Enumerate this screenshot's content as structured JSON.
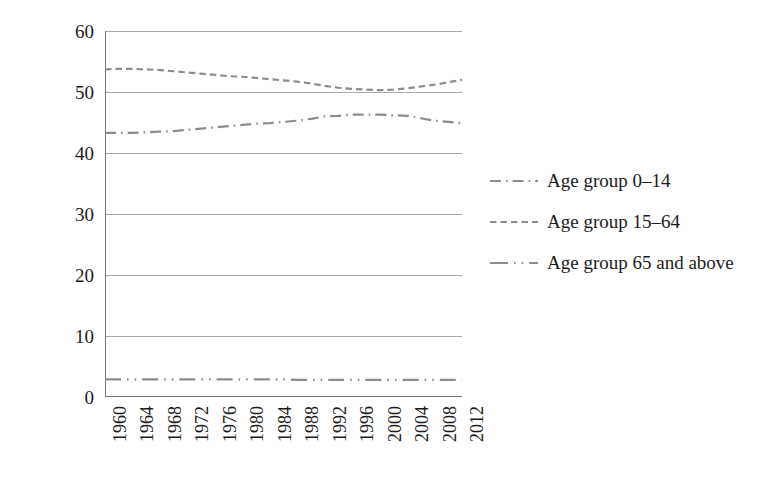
{
  "chart_data": {
    "type": "line",
    "title": "",
    "xlabel": "",
    "ylabel": "Age groups (%)",
    "xlim": [
      1960,
      2012
    ],
    "ylim": [
      0,
      60
    ],
    "grid": true,
    "legend_position": "right",
    "y_ticks": [
      60,
      50,
      40,
      30,
      20,
      10,
      0
    ],
    "x_ticks": [
      1960,
      1964,
      1968,
      1972,
      1976,
      1980,
      1984,
      1988,
      1992,
      1996,
      2000,
      2004,
      2008,
      2012
    ],
    "x_minor_tick_step": 1,
    "x": [
      1960,
      1962,
      1964,
      1966,
      1968,
      1970,
      1972,
      1974,
      1976,
      1978,
      1980,
      1982,
      1984,
      1986,
      1988,
      1990,
      1992,
      1994,
      1996,
      1998,
      2000,
      2002,
      2004,
      2006,
      2008,
      2010,
      2012
    ],
    "series": [
      {
        "name": "Age group 0–14",
        "dash": "dash-dot",
        "color": "#8c8c8c",
        "values": [
          43.3,
          43.3,
          43.3,
          43.4,
          43.5,
          43.6,
          43.8,
          44.0,
          44.2,
          44.4,
          44.6,
          44.8,
          44.9,
          45.1,
          45.3,
          45.6,
          46.0,
          46.1,
          46.3,
          46.3,
          46.3,
          46.2,
          46.1,
          45.7,
          45.3,
          45.1,
          44.9
        ]
      },
      {
        "name": "Age group 15–64",
        "dash": "dashed",
        "color": "#8c8c8c",
        "values": [
          53.7,
          53.8,
          53.8,
          53.7,
          53.6,
          53.4,
          53.2,
          53.0,
          52.8,
          52.6,
          52.5,
          52.3,
          52.1,
          51.9,
          51.7,
          51.4,
          51.0,
          50.7,
          50.5,
          50.4,
          50.3,
          50.4,
          50.6,
          50.9,
          51.2,
          51.6,
          52.0
        ]
      },
      {
        "name": "Age group 65 and above",
        "dash": "dash-dot-dot",
        "color": "#8c8c8c",
        "values": [
          2.9,
          2.9,
          2.9,
          2.9,
          2.9,
          2.9,
          2.9,
          2.9,
          2.9,
          2.9,
          2.9,
          2.9,
          2.9,
          2.9,
          2.8,
          2.8,
          2.8,
          2.8,
          2.8,
          2.8,
          2.8,
          2.8,
          2.8,
          2.8,
          2.8,
          2.8,
          2.8
        ]
      }
    ]
  },
  "axes": {
    "y_title": "Age groups (%)",
    "y_tick_labels": [
      "60",
      "50",
      "40",
      "30",
      "20",
      "10",
      "0"
    ],
    "x_tick_labels": [
      "1960",
      "1964",
      "1968",
      "1972",
      "1976",
      "1980",
      "1984",
      "1988",
      "1992",
      "1996",
      "2000",
      "2004",
      "2008",
      "2012"
    ]
  },
  "legend": {
    "items": [
      {
        "label": "Age group 0–14",
        "key": "dash-dot-key"
      },
      {
        "label": "Age group 15–64",
        "key": "dashed-key"
      },
      {
        "label": "Age group 65 and above",
        "key": "dash-dot-dot-key"
      }
    ]
  },
  "colors": {
    "background": "#ffffff",
    "line": "#8c8c8c",
    "grid": "#aaaaaa",
    "axis": "#777777",
    "text": "#1b1b1b"
  }
}
